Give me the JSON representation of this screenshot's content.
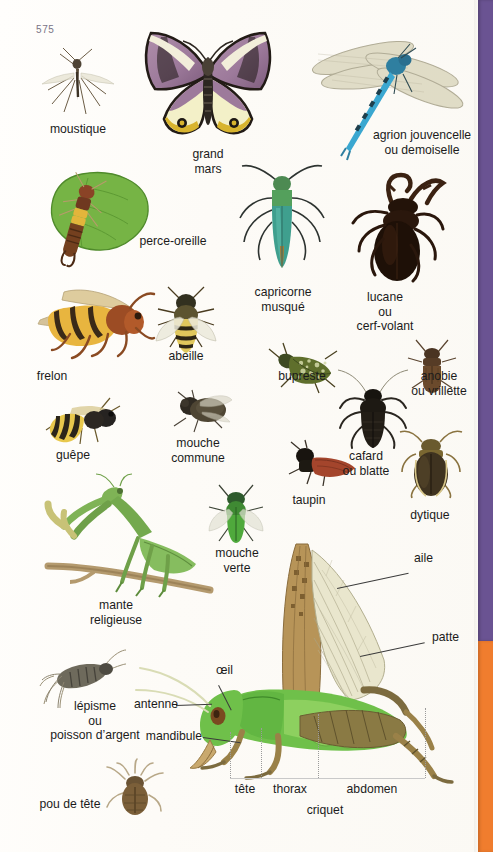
{
  "page": {
    "number": "575",
    "language": "fr",
    "background_color": "#fdfbf7",
    "edge_bands": [
      {
        "name": "purple-tab",
        "color": "#6a5392"
      },
      {
        "name": "orange-tab",
        "color": "#f07d2e"
      }
    ]
  },
  "plate_title": "criquet",
  "specimens": [
    {
      "id": "moustique",
      "label": "moustique"
    },
    {
      "id": "grand-mars",
      "label": "grand\nmars"
    },
    {
      "id": "agrion",
      "label": "agrion jouvencelle\nou demoiselle"
    },
    {
      "id": "perce-oreille",
      "label": "perce-oreille"
    },
    {
      "id": "capricorne",
      "label": "capricorne\nmusqué"
    },
    {
      "id": "lucane",
      "label": "lucane\nou\ncerf-volant"
    },
    {
      "id": "frelon",
      "label": "frelon"
    },
    {
      "id": "abeille",
      "label": "abeille"
    },
    {
      "id": "bupreste",
      "label": "bupreste"
    },
    {
      "id": "anobie",
      "label": "anobie\nou vrillette"
    },
    {
      "id": "guepe",
      "label": "guêpe"
    },
    {
      "id": "mouche-commune",
      "label": "mouche\ncommune"
    },
    {
      "id": "cafard",
      "label": "cafard\nou blatte"
    },
    {
      "id": "taupin",
      "label": "taupin"
    },
    {
      "id": "dytique",
      "label": "dytique"
    },
    {
      "id": "mante",
      "label": "mante\nreligieuse"
    },
    {
      "id": "mouche-verte",
      "label": "mouche\nverte"
    },
    {
      "id": "lepisme",
      "label": "lépisme\nou\npoisson d’argent"
    },
    {
      "id": "pou-de-tete",
      "label": "pou de tête"
    },
    {
      "id": "criquet",
      "label": "criquet"
    }
  ],
  "criquet_callouts": [
    {
      "id": "aile",
      "label": "aile"
    },
    {
      "id": "patte",
      "label": "patte"
    },
    {
      "id": "oeil",
      "label": "œil"
    },
    {
      "id": "antenne",
      "label": "antenne"
    },
    {
      "id": "mandibule",
      "label": "mandibule"
    }
  ],
  "criquet_segments": [
    {
      "id": "tete",
      "label": "tête"
    },
    {
      "id": "thorax",
      "label": "thorax"
    },
    {
      "id": "abdomen",
      "label": "abdomen"
    }
  ]
}
